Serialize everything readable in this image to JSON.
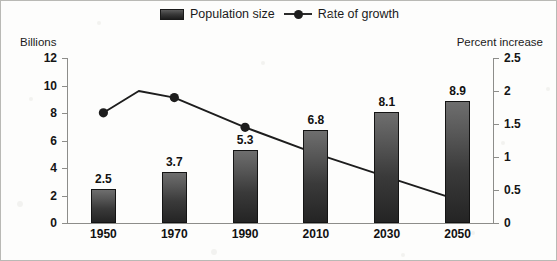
{
  "legend": {
    "items": [
      {
        "label": "Population size",
        "marker": "bar-swatch-icon",
        "color": "#3a3a3a"
      },
      {
        "label": "Rate of growth",
        "marker": "line-marker-icon",
        "color": "#1d1d1d"
      }
    ]
  },
  "axes": {
    "left_title": "Billions",
    "right_title": "Percent increase",
    "left_ticks": [
      "12",
      "10",
      "8",
      "6",
      "4",
      "2",
      "0"
    ],
    "right_ticks": [
      "2.5",
      "2",
      "1.5",
      "1",
      "0.5",
      "0"
    ]
  },
  "chart_data": {
    "type": "bar",
    "title": "",
    "subtitle": "",
    "xlabel": "",
    "ylabel": "Billions",
    "y2label": "Percent increase",
    "categories": [
      "1950",
      "1970",
      "1990",
      "2010",
      "2030",
      "2050"
    ],
    "ylim": [
      0,
      12
    ],
    "y2lim": [
      0,
      2.5
    ],
    "ytick_step": 2,
    "y2tick_step": 0.5,
    "grid": false,
    "legend_position": "top-center",
    "series": [
      {
        "name": "Population size",
        "type": "bar",
        "axis": "left",
        "unit": "billions",
        "values": [
          2.5,
          3.7,
          5.3,
          6.8,
          8.1,
          8.9
        ],
        "data_labels": [
          "2.5",
          "3.7",
          "5.3",
          "6.8",
          "8.1",
          "8.9"
        ],
        "color": "#3a3a3a"
      },
      {
        "name": "Rate of growth",
        "type": "line",
        "axis": "right",
        "unit": "percent increase",
        "values": [
          1.67,
          1.9,
          1.45,
          1.05,
          0.7,
          0.35
        ],
        "peak_between_1950_and_1970": 2.0,
        "data_labels": [],
        "color": "#1d1d1d",
        "marker": "circle"
      }
    ]
  }
}
